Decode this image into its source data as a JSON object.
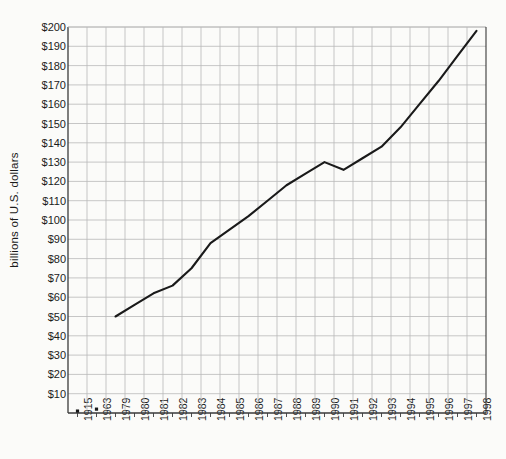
{
  "chart_data": {
    "type": "line",
    "title": "",
    "xlabel": "",
    "ylabel": "billions of U.S. dollars",
    "ylim": [
      0,
      200
    ],
    "ytick_labels": [
      "$200",
      "$190",
      "$180",
      "$170",
      "$160",
      "$150",
      "$140",
      "$130",
      "$120",
      "$110",
      "$100",
      "$90",
      "$80",
      "$70",
      "$60",
      "$50",
      "$40",
      "$30",
      "$20",
      "$10"
    ],
    "ytick_values": [
      200,
      190,
      180,
      170,
      160,
      150,
      140,
      130,
      120,
      110,
      100,
      90,
      80,
      70,
      60,
      50,
      40,
      30,
      20,
      10
    ],
    "categories": [
      "1915",
      "1963",
      "1979",
      "1980",
      "1981",
      "1982",
      "1983",
      "1984",
      "1985",
      "1986",
      "1987",
      "1988",
      "1989",
      "1990",
      "1991",
      "1992",
      "1993",
      "1994",
      "1995",
      "1996",
      "1997",
      "1998"
    ],
    "values": [
      1,
      2,
      50,
      56,
      62,
      66,
      75,
      88,
      95,
      102,
      110,
      118,
      124,
      130,
      126,
      132,
      138,
      148,
      160,
      172,
      185,
      198
    ],
    "markers_only": [
      "1915",
      "1963"
    ],
    "line_starts_at": "1979",
    "grid": true,
    "legend": "none",
    "line_color": "#1a1a1a",
    "grid_color": "#b9b9b9",
    "axis_color": "#3a3a3a",
    "background_color": "#fbfbf9"
  },
  "plot_geometry": {
    "left": 68,
    "right": 486,
    "top": 27,
    "bottom": 413,
    "category_step": 19.9
  }
}
